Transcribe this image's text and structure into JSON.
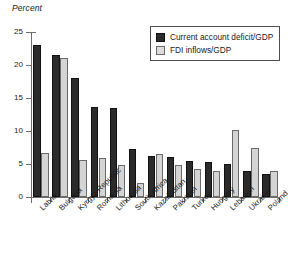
{
  "chart_data": {
    "type": "bar",
    "title": "",
    "ylabel": "Percent",
    "xlabel": "",
    "ylim": [
      0,
      25
    ],
    "yticks": [
      0,
      5,
      10,
      15,
      20,
      25
    ],
    "grid": false,
    "legend_position": "top-right",
    "categories": [
      "Latvia",
      "Bulgaria",
      "Kyrgyz Republic",
      "Romania",
      "Lithuania",
      "South Africa",
      "Kazakhstan",
      "Pakistan",
      "Turkey",
      "Hungary",
      "Lebanon",
      "Ukraine",
      "Poland"
    ],
    "series": [
      {
        "name": "Current account deficit/GDP",
        "color": "#2b2b2b",
        "values": [
          23.0,
          21.5,
          18.0,
          13.6,
          13.5,
          7.3,
          6.2,
          6.0,
          5.5,
          5.3,
          5.0,
          4.0,
          3.5
        ]
      },
      {
        "name": "FDI inflows/GDP",
        "color": "#d4d4d4",
        "values": [
          6.6,
          21.0,
          5.6,
          5.9,
          4.9,
          2.1,
          6.5,
          4.9,
          4.3,
          3.9,
          10.1,
          7.5,
          4.0
        ]
      }
    ]
  },
  "legend": {
    "items": [
      {
        "label": "Current account deficit/GDP",
        "swatch": "dark"
      },
      {
        "label": "FDI inflows/GDP",
        "swatch": "light"
      }
    ]
  }
}
